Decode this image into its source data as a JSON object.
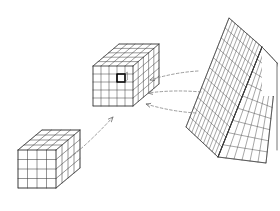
{
  "figure": {
    "title": "Voxel cube to folded grid surface diagram",
    "background_color": "#ffffff",
    "line_color": "#3a3a3a",
    "dashed_color": "#8a8a8a",
    "highlight_color": "#000000",
    "width": 280,
    "height": 211
  },
  "elements": {
    "small_cube": {
      "label": "small voxel cube",
      "divisions_x": 4,
      "divisions_y": 4,
      "divisions_z": 4,
      "origin_x": 18,
      "origin_y": 188,
      "cell_w": 9.5,
      "cell_h": 9.5,
      "depth_dx": 6.0,
      "depth_dy": -5.0
    },
    "main_cube": {
      "label": "main voxel cube",
      "divisions_x": 5,
      "divisions_y": 5,
      "divisions_z": 5,
      "origin_x": 93,
      "origin_y": 106,
      "cell_w": 8.0,
      "cell_h": 8.0,
      "depth_dx": 5.2,
      "depth_dy": -4.4
    },
    "highlighted_voxel": {
      "label": "selected voxel",
      "col": 3,
      "row": 3,
      "stroke_width": 1.6
    },
    "folded_surface": {
      "label": "folded grid surface",
      "left_face_type": "diamond-grid",
      "right_face_type": "rectangular-grid",
      "left_face_cols": 11,
      "left_face_rows": 11,
      "right_face_cols": 6,
      "right_face_rows": 9
    }
  },
  "arrows": [
    {
      "name": "small-cube-to-main-cube",
      "style": "dashed",
      "from_x": 70,
      "from_y": 158,
      "to_x": 113,
      "to_y": 117,
      "direction": "up-right"
    },
    {
      "name": "surface-to-cube-upper",
      "style": "dashed",
      "from_x": 198,
      "from_y": 71,
      "to_x": 150,
      "to_y": 80,
      "direction": "left"
    },
    {
      "name": "surface-to-cube-middle",
      "style": "dashed",
      "from_x": 201,
      "from_y": 92,
      "to_x": 148,
      "to_y": 93,
      "direction": "left"
    },
    {
      "name": "surface-to-cube-lower",
      "style": "dashed",
      "from_x": 196,
      "from_y": 113,
      "to_x": 146,
      "to_y": 104,
      "direction": "left-down"
    }
  ]
}
